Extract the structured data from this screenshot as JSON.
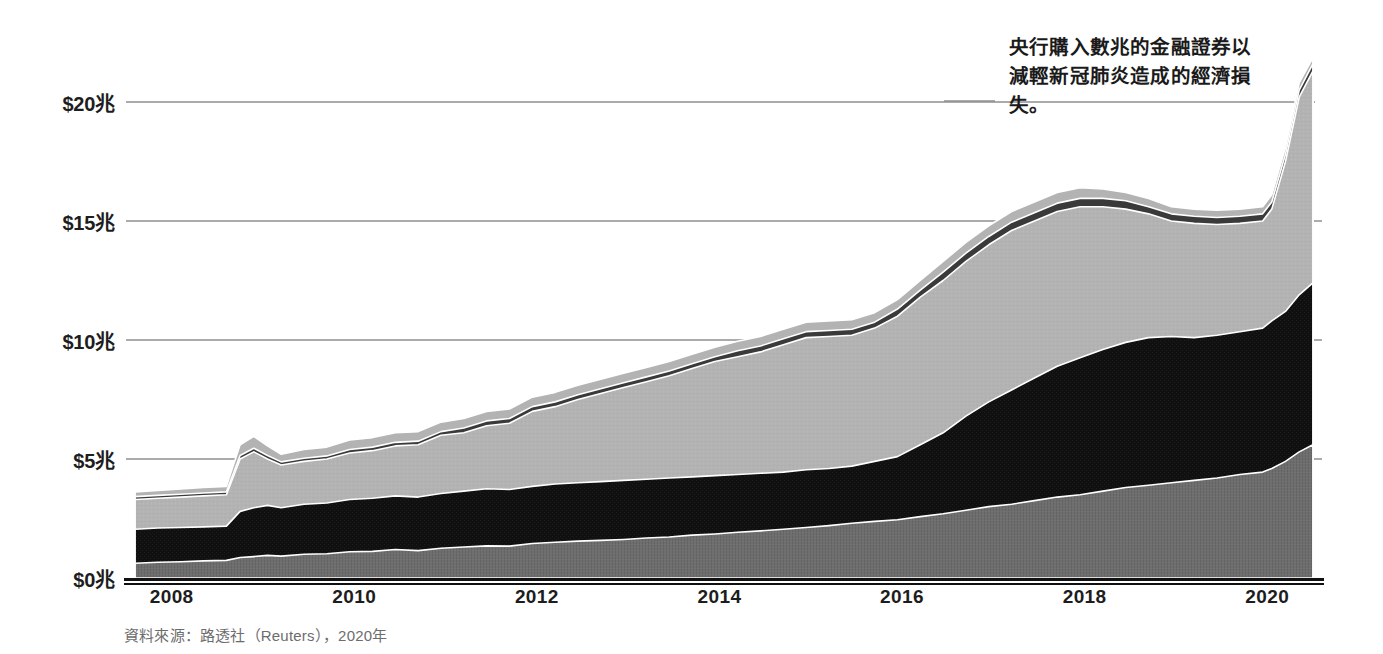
{
  "figure": {
    "annotation": "央行購入數兆的金融證券以減輕新冠肺炎造成的經濟損失。",
    "source_note": "資料來源：路透社（Reuters），2020年",
    "background_color": "#ffffff",
    "gridline_color": "#8f8f8f",
    "axis_color": "#111111"
  },
  "chart_data": {
    "type": "area",
    "stacked": true,
    "title": "",
    "subtitle": "",
    "xlabel": "",
    "ylabel": "",
    "xlim": [
      2007.5,
      2020.6
    ],
    "ylim": [
      0,
      22
    ],
    "grid": true,
    "legend_position": "none",
    "annotations": [
      {
        "text": "央行購入數兆的金融證券以減輕新冠肺炎造成的經濟損失。",
        "x": 2020.1,
        "y": 20.5,
        "leader_line": true
      }
    ],
    "y_tick_labels": [
      "$0兆",
      "$5兆",
      "$10兆",
      "$15兆",
      "$20兆"
    ],
    "y_tick_values": [
      0,
      5,
      10,
      15,
      20
    ],
    "x_tick_labels": [
      "2008",
      "2010",
      "2012",
      "2014",
      "2016",
      "2018",
      "2020"
    ],
    "x_tick_values": [
      2008,
      2010,
      2012,
      2014,
      2016,
      2018,
      2020
    ],
    "series_colors": {
      "layer_1": "#6e6e6e",
      "layer_2": "#121212",
      "layer_3": "#b3b3b3",
      "layer_4": "#3a3a3a",
      "layer_5": "#b3b3b3"
    },
    "x": [
      2007.6,
      2007.85,
      2008.1,
      2008.35,
      2008.6,
      2008.75,
      2008.9,
      2009.05,
      2009.2,
      2009.45,
      2009.7,
      2009.95,
      2010.2,
      2010.45,
      2010.7,
      2010.95,
      2011.2,
      2011.45,
      2011.7,
      2011.95,
      2012.2,
      2012.45,
      2012.7,
      2012.95,
      2013.2,
      2013.45,
      2013.7,
      2013.95,
      2014.2,
      2014.45,
      2014.7,
      2014.95,
      2015.2,
      2015.45,
      2015.7,
      2015.95,
      2016.2,
      2016.45,
      2016.7,
      2016.95,
      2017.2,
      2017.45,
      2017.7,
      2017.95,
      2018.2,
      2018.45,
      2018.7,
      2018.95,
      2019.2,
      2019.45,
      2019.7,
      2019.95,
      2020.05,
      2020.2,
      2020.35,
      2020.5
    ],
    "series": [
      {
        "name": "layer_1",
        "values": [
          0.62,
          0.66,
          0.68,
          0.72,
          0.74,
          0.86,
          0.9,
          0.95,
          0.92,
          1.0,
          1.02,
          1.1,
          1.12,
          1.2,
          1.15,
          1.25,
          1.3,
          1.35,
          1.34,
          1.45,
          1.5,
          1.55,
          1.58,
          1.62,
          1.68,
          1.72,
          1.8,
          1.85,
          1.92,
          1.98,
          2.05,
          2.12,
          2.2,
          2.3,
          2.38,
          2.45,
          2.58,
          2.7,
          2.85,
          3.0,
          3.1,
          3.25,
          3.4,
          3.5,
          3.65,
          3.8,
          3.9,
          4.0,
          4.1,
          4.2,
          4.35,
          4.45,
          4.6,
          4.9,
          5.3,
          5.6
        ]
      },
      {
        "name": "layer_2",
        "values": [
          2.05,
          2.1,
          2.12,
          2.15,
          2.18,
          2.8,
          2.95,
          3.05,
          2.95,
          3.1,
          3.15,
          3.3,
          3.35,
          3.45,
          3.4,
          3.55,
          3.65,
          3.75,
          3.72,
          3.85,
          3.95,
          4.0,
          4.05,
          4.1,
          4.15,
          4.2,
          4.25,
          4.3,
          4.35,
          4.4,
          4.45,
          4.55,
          4.6,
          4.7,
          4.9,
          5.1,
          5.6,
          6.1,
          6.8,
          7.4,
          7.9,
          8.4,
          8.9,
          9.25,
          9.6,
          9.9,
          10.1,
          10.15,
          10.1,
          10.2,
          10.35,
          10.5,
          10.8,
          11.2,
          11.9,
          12.4
        ]
      },
      {
        "name": "layer_3",
        "values": [
          3.3,
          3.35,
          3.4,
          3.45,
          3.5,
          5.0,
          5.3,
          5.0,
          4.75,
          4.9,
          5.0,
          5.25,
          5.35,
          5.55,
          5.6,
          6.0,
          6.1,
          6.4,
          6.5,
          7.0,
          7.2,
          7.5,
          7.75,
          8.0,
          8.25,
          8.5,
          8.8,
          9.1,
          9.3,
          9.5,
          9.8,
          10.1,
          10.15,
          10.2,
          10.5,
          11.0,
          11.8,
          12.5,
          13.3,
          14.0,
          14.6,
          15.0,
          15.4,
          15.6,
          15.6,
          15.5,
          15.3,
          15.0,
          14.9,
          14.85,
          14.9,
          15.0,
          15.5,
          17.5,
          20.2,
          21.3
        ]
      },
      {
        "name": "layer_4",
        "values": [
          3.42,
          3.47,
          3.52,
          3.57,
          3.62,
          5.15,
          5.45,
          5.15,
          4.88,
          5.03,
          5.13,
          5.4,
          5.5,
          5.7,
          5.75,
          6.15,
          6.3,
          6.6,
          6.7,
          7.2,
          7.4,
          7.7,
          7.95,
          8.2,
          8.45,
          8.7,
          9.0,
          9.3,
          9.55,
          9.75,
          10.05,
          10.35,
          10.4,
          10.45,
          10.75,
          11.3,
          12.1,
          12.85,
          13.65,
          14.35,
          14.95,
          15.35,
          15.75,
          15.95,
          15.95,
          15.85,
          15.6,
          15.3,
          15.2,
          15.15,
          15.2,
          15.3,
          15.8,
          17.8,
          20.5,
          21.6
        ]
      },
      {
        "name": "layer_5",
        "values": [
          3.62,
          3.68,
          3.74,
          3.8,
          3.85,
          5.6,
          5.95,
          5.55,
          5.2,
          5.4,
          5.5,
          5.8,
          5.9,
          6.1,
          6.15,
          6.55,
          6.7,
          7.0,
          7.1,
          7.6,
          7.8,
          8.1,
          8.35,
          8.6,
          8.85,
          9.1,
          9.4,
          9.7,
          9.95,
          10.15,
          10.45,
          10.75,
          10.8,
          10.85,
          11.15,
          11.7,
          12.5,
          13.3,
          14.1,
          14.8,
          15.4,
          15.8,
          16.2,
          16.4,
          16.35,
          16.2,
          15.95,
          15.6,
          15.5,
          15.45,
          15.5,
          15.6,
          16.1,
          18.1,
          20.8,
          21.85
        ]
      }
    ]
  }
}
